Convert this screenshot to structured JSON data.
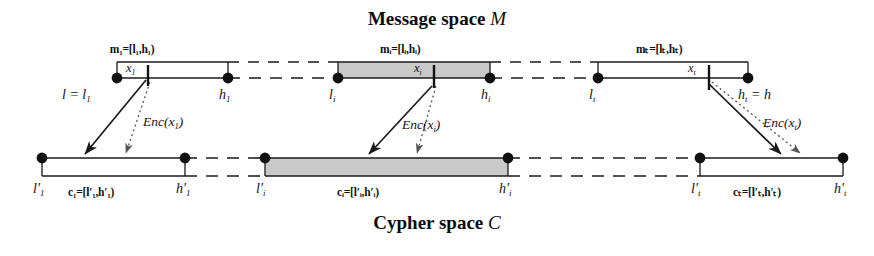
{
  "title_top": {
    "text": "Message space ",
    "symbol": "M"
  },
  "title_bottom": {
    "text": "Cypher space ",
    "symbol": "C"
  },
  "message_space": {
    "intervals": [
      {
        "id": "m1",
        "tag_name": "m",
        "tag_sub": "1",
        "tag_body": "=[l",
        "tag_sub2": "1",
        "tag_mid": ",h",
        "tag_sub3": "1",
        "tag_end": ")",
        "tag_full": "m₁=[l₁,h₁)",
        "point_label": "x",
        "point_sub": "1",
        "left_label": "l = l",
        "left_sub": "1",
        "right_label": "h",
        "right_sub": "1",
        "shaded": false
      },
      {
        "id": "mi",
        "tag_full": "mᵢ=[lᵢ,hᵢ)",
        "point_label": "x",
        "point_sub": "i",
        "left_label": "l",
        "left_sub": "i",
        "right_label": "h",
        "right_sub": "i",
        "shaded": true
      },
      {
        "id": "mt",
        "tag_full": "mₜ=[lₜ,hₜ)",
        "point_label": "x",
        "point_sub": "t",
        "left_label": "l",
        "left_sub": "t",
        "right_label": "h",
        "right_sub": "t",
        "right_suffix": " = h",
        "shaded": false
      }
    ]
  },
  "cypher_space": {
    "intervals": [
      {
        "id": "c1",
        "tag_full": "c₁=[l′₁,h′₁)",
        "left_label": "l′",
        "left_sub": "1",
        "right_label": "h′",
        "right_sub": "1",
        "shaded": false
      },
      {
        "id": "ci",
        "tag_full": "cᵢ=[l′ᵢ,h′ᵢ)",
        "left_label": "l′",
        "left_sub": "i",
        "right_label": "h′",
        "right_sub": "i",
        "shaded": true
      },
      {
        "id": "ct",
        "tag_full": "cₜ=[l′ₜ,h′ₜ)",
        "left_label": "l′",
        "left_sub": "t",
        "right_label": "h′",
        "right_sub": "t",
        "shaded": false
      }
    ]
  },
  "enc_labels": [
    {
      "id": "enc1",
      "name": "Enc(",
      "arg": "x",
      "sub": "1",
      "close": ")"
    },
    {
      "id": "enci",
      "name": "Enc(",
      "arg": "x",
      "sub": "i",
      "close": ")"
    },
    {
      "id": "enct",
      "name": "Enc(",
      "arg": "x",
      "sub": "t",
      "close": ")"
    }
  ],
  "colors": {
    "line": "#1a1a1a",
    "shade": "#c9c9c9",
    "text": "#111111",
    "background": "#ffffff"
  }
}
